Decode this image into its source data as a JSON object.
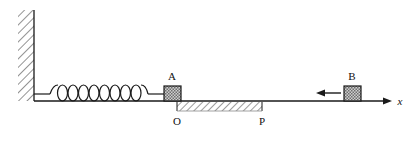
{
  "figure": {
    "kind": "physics-mechanics-diagram",
    "background_color": "#ffffff",
    "line_color": "#1a1a1a",
    "hatch_color": "#555555",
    "block_fill": "#c8c8c8",
    "labels": {
      "block_a": "A",
      "block_b": "B",
      "origin": "O",
      "point_p": "P",
      "axis": "x"
    },
    "elements": {
      "wall": "wall-hatched",
      "spring": "spring-coil",
      "ground": "ground-line",
      "rough_region": "rough-surface-hatched",
      "velocity_arrow": "left-arrow",
      "axis_arrow": "right-arrow"
    },
    "spring": {
      "coil_count": 8,
      "start_x": 50,
      "end_x": 148
    },
    "geometry": {
      "wall_left": 18,
      "wall_right": 34,
      "wall_top": 10,
      "ground_y": 101,
      "axis_end_x": 388,
      "origin_x": 177,
      "point_p_x": 262,
      "block_a_x": 164,
      "block_b_x": 344
    }
  }
}
